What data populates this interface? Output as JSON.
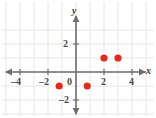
{
  "chart_data": {
    "type": "scatter",
    "title": "",
    "xlabel": "x",
    "ylabel": "y",
    "xlim": [
      -4.9,
      5.2
    ],
    "ylim": [
      -2.8,
      2.9
    ],
    "grid": true,
    "legend": false,
    "point_color": "#e02b20",
    "axis_color": "#6e6e6e",
    "grid_color": "#e3e3e3",
    "x_ticks": [
      -4,
      -2,
      0,
      2,
      4
    ],
    "x_tick_labels": [
      "–4",
      "–2",
      "0",
      "2",
      "4"
    ],
    "y_ticks": [
      2,
      -2
    ],
    "y_tick_labels": [
      "2",
      "–2"
    ],
    "points": [
      {
        "x": -1.2,
        "y": -1,
        "label": "point-1"
      },
      {
        "x": 0.8,
        "y": -1,
        "label": "point-2"
      },
      {
        "x": 2,
        "y": 1,
        "label": "point-3"
      },
      {
        "x": 3,
        "y": 1,
        "label": "point-4"
      }
    ]
  },
  "figure": {
    "origin_px": {
      "x": 76,
      "y": 72
    },
    "unit_px": 14
  }
}
